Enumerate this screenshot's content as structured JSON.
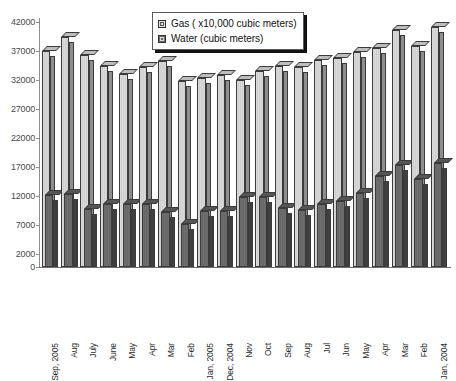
{
  "chart_data": {
    "type": "bar",
    "title": "",
    "subtitle": "",
    "xlabel": "",
    "ylabel": "",
    "grid": false,
    "legend_position": "top-center",
    "ylim": [
      0,
      42000
    ],
    "yticks": [
      0,
      2000,
      7000,
      12000,
      17000,
      22000,
      27000,
      32000,
      37000,
      42000
    ],
    "ytick_labels": [
      "0",
      "2000",
      "7000",
      "12000",
      "17000",
      "22000",
      "27000",
      "32000",
      "37000",
      "42000"
    ],
    "categories": [
      "Sep, 2005",
      "Aug",
      "July",
      "June",
      "May",
      "Apr",
      "Mar",
      "Feb",
      "Jan, 2005",
      "Dec, 2004",
      "Nov",
      "Oct",
      "Sep",
      "Aug",
      "Jul",
      "Jun",
      "May",
      "Apr",
      "Mar",
      "Feb",
      "Jan, 2004"
    ],
    "series": [
      {
        "name": "Gas ( x10,000 cubic meters)",
        "color": "#d4d4d4",
        "values": [
          37000,
          39500,
          36300,
          34500,
          33000,
          34200,
          35300,
          31800,
          32300,
          32800,
          32000,
          33500,
          34400,
          34300,
          35500,
          35800,
          36800,
          37600,
          40600,
          37800,
          41200
        ]
      },
      {
        "name": "Water (cubic meters)",
        "color": "#6b6b6b",
        "values": [
          12200,
          12300,
          9700,
          10700,
          10700,
          10700,
          9300,
          7200,
          9500,
          9500,
          11800,
          11800,
          9900,
          9600,
          10600,
          11200,
          12600,
          15500,
          17400,
          14900,
          17700
        ]
      }
    ]
  },
  "legend": {
    "items": [
      {
        "label": "Gas ( x10,000 cubic meters)",
        "swatch": "gas-sw"
      },
      {
        "label": "Water (cubic meters)",
        "swatch": "water-sw"
      }
    ]
  }
}
